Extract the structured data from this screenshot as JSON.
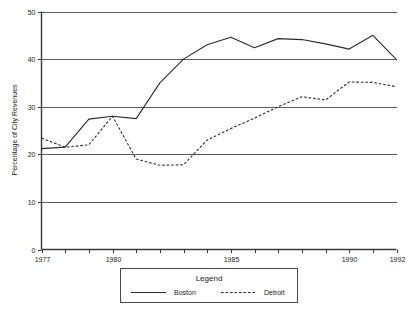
{
  "chart_data": {
    "type": "line",
    "title": "",
    "xlabel": "",
    "ylabel": "Percentage of City Revenues",
    "xlim": [
      1977,
      1992
    ],
    "ylim": [
      0,
      50
    ],
    "grid": true,
    "y_ticks": [
      0,
      10,
      20,
      30,
      40,
      50
    ],
    "y_tick_labels": [
      "0",
      "10",
      "20",
      "30",
      "40",
      "50"
    ],
    "x_ticks": [
      1977,
      1978,
      1979,
      1980,
      1981,
      1982,
      1983,
      1984,
      1985,
      1986,
      1987,
      1988,
      1989,
      1990,
      1991,
      1992
    ],
    "x_tick_labels_shown": [
      "1977",
      "1980",
      "1985",
      "1990",
      "1992"
    ],
    "x_labeled_years": [
      1977,
      1980,
      1985,
      1990,
      1992
    ],
    "x": [
      1977,
      1978,
      1979,
      1980,
      1981,
      1982,
      1983,
      1984,
      1985,
      1986,
      1987,
      1988,
      1989,
      1990,
      1991,
      1992
    ],
    "series": [
      {
        "name": "Boston",
        "style": "solid",
        "color": "#2b2b2b",
        "values": [
          21.2,
          21.5,
          27.4,
          28.0,
          27.5,
          35.0,
          40.0,
          43.0,
          44.6,
          42.4,
          44.3,
          44.1,
          43.2,
          42.1,
          45.0,
          39.9
        ]
      },
      {
        "name": "Detroit",
        "style": "dashed",
        "color": "#2b2b2b",
        "values": [
          23.4,
          21.5,
          22.0,
          28.0,
          19.0,
          17.7,
          17.8,
          23.0,
          25.4,
          27.6,
          30.0,
          32.1,
          31.4,
          35.2,
          35.1,
          34.2
        ]
      }
    ],
    "legend": {
      "position": "bottom",
      "title": "Legend",
      "entries": [
        {
          "label": "Boston",
          "style": "solid"
        },
        {
          "label": "Detroit",
          "style": "dashed"
        }
      ]
    }
  }
}
